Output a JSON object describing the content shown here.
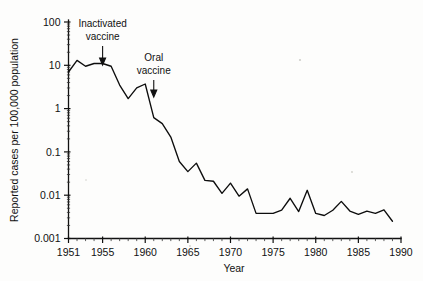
{
  "figure": {
    "background_color": "#fdfdfc",
    "line_color": "#0d0d0d",
    "axis_color": "#111111"
  },
  "chart_data": {
    "type": "line",
    "title": "",
    "xlabel": "Year",
    "ylabel": "Reported cases per 100,000 population",
    "yscale": "log",
    "xlim": [
      1951,
      1990
    ],
    "ylim": [
      0.001,
      100
    ],
    "grid": false,
    "legend": null,
    "x_ticks": [
      1951,
      1955,
      1960,
      1965,
      1970,
      1975,
      1980,
      1985,
      1990
    ],
    "x_tick_labels": [
      "1951",
      "1955",
      "1960",
      "1965",
      "1970",
      "1975",
      "1980",
      "1985",
      "1990"
    ],
    "y_ticks": [
      100,
      10,
      1,
      0.1,
      0.01,
      0.001
    ],
    "y_tick_labels": [
      "100",
      "10",
      "1",
      "0.1",
      "0.01",
      "0.001"
    ],
    "series": [
      {
        "name": "Reported poliomyelitis cases",
        "x": [
          1951,
          1952,
          1953,
          1954,
          1955,
          1956,
          1957,
          1958,
          1959,
          1960,
          1961,
          1962,
          1963,
          1964,
          1965,
          1966,
          1967,
          1968,
          1969,
          1970,
          1971,
          1972,
          1973,
          1974,
          1975,
          1976,
          1977,
          1978,
          1979,
          1980,
          1981,
          1982,
          1983,
          1984,
          1985,
          1986,
          1987,
          1988,
          1989
        ],
        "values": [
          7.0,
          13.0,
          9.5,
          11.0,
          11.0,
          9.5,
          3.5,
          1.7,
          3.0,
          3.7,
          0.62,
          0.45,
          0.22,
          0.06,
          0.035,
          0.055,
          0.022,
          0.021,
          0.011,
          0.019,
          0.0095,
          0.014,
          0.0038,
          0.0038,
          0.0038,
          0.0045,
          0.0085,
          0.0042,
          0.013,
          0.0038,
          0.0034,
          0.0045,
          0.0072,
          0.0043,
          0.0036,
          0.0043,
          0.0038,
          0.0046,
          0.0025
        ]
      }
    ],
    "annotations": [
      {
        "name": "inactivated-vaccine",
        "label_line1": "Inactivated",
        "label_line2": "vaccine",
        "x": 1955,
        "arrow": "down"
      },
      {
        "name": "oral-vaccine",
        "label_line1": "Oral",
        "label_line2": "vaccine",
        "x": 1961,
        "arrow": "down"
      }
    ]
  }
}
